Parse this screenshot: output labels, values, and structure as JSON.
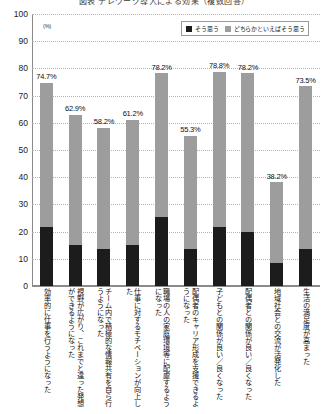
{
  "title": "図表 テレワーク導入による効果（複数回答）",
  "legend": {
    "position": "top-right",
    "entries": [
      {
        "label": "そう思う",
        "color": "#1c1c1c",
        "icon": "square-swatch-dark"
      },
      {
        "label": "どちらかといえばそう思う",
        "color": "#9d9d9d",
        "icon": "square-swatch-light"
      }
    ]
  },
  "axis": {
    "y_unit": "(%)",
    "y_ticks": [
      "100",
      "90",
      "80",
      "70",
      "60",
      "50",
      "40",
      "30",
      "20",
      "10",
      "0"
    ]
  },
  "chart_data": {
    "type": "bar",
    "title": "図表 テレワーク導入による効果（複数回答）",
    "xlabel": "",
    "ylabel": "(%)",
    "ylim": [
      0,
      100
    ],
    "ytick_step": 10,
    "grid": true,
    "stacked": true,
    "legend_position": "top-right",
    "categories": [
      "効率的に仕事を行うようになった",
      "視野が広がり、これまでと違った発想ができるようになった",
      "チーム内で積極的な情報共有を自ら行うようになった",
      "仕事に対するモチベーションが向上した",
      "職場の人の家庭環境等に配慮するようになった",
      "配偶者のキャリア形成を支援できるようになった",
      "子どもとの関係が良い／良くなった",
      "配偶者との関係が良い／良くなった",
      "地域社会との交流が活発化した",
      "生活の満足度が高まった"
    ],
    "series": [
      {
        "name": "そう思う",
        "color": "#1c1c1c",
        "values": [
          21.6,
          14.9,
          13.5,
          14.9,
          25.4,
          13.7,
          21.8,
          19.7,
          8.3,
          13.6
        ]
      },
      {
        "name": "どちらかといえばそう思う",
        "color": "#9d9d9d",
        "values": [
          53.1,
          48.0,
          44.7,
          46.3,
          52.8,
          41.6,
          57.0,
          58.5,
          29.9,
          59.9
        ]
      }
    ],
    "totals": [
      74.7,
      62.9,
      58.2,
      61.2,
      78.2,
      55.3,
      78.8,
      78.2,
      38.2,
      73.5
    ],
    "data_labels": [
      "74.7%",
      "62.9%",
      "58.2%",
      "61.2%",
      "78.2%",
      "55.3%",
      "78.8%",
      "78.2%",
      "38.2%",
      "73.5%"
    ]
  }
}
